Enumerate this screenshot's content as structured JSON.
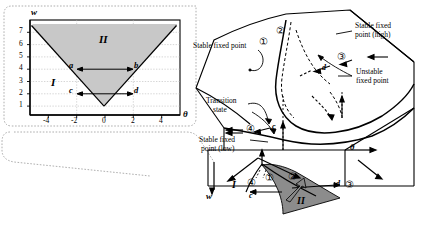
{
  "figure": {
    "type": "cusp-catastrophe-diagram"
  },
  "inset": {
    "name": "bifurcation-set-inset",
    "axes": {
      "x_label": "θ",
      "y_label": "w",
      "x_ticks": [
        "-4",
        "-2",
        "0",
        "2",
        "4"
      ],
      "y_ticks": [
        "1",
        "2",
        "3",
        "4",
        "5",
        "6",
        "7"
      ],
      "x_min": -5.3,
      "x_max": 5.3,
      "y_min": 0.3,
      "y_max": 7.6
    },
    "regions": [
      {
        "label": "I",
        "kind": "single-stable-state",
        "shaded": false
      },
      {
        "label": "II",
        "kind": "bistable-region",
        "shaded": true
      }
    ],
    "points": [
      {
        "label": "a",
        "theta": -2,
        "w": 4
      },
      {
        "label": "b",
        "theta": 2,
        "w": 4
      },
      {
        "label": "c",
        "theta": -2,
        "w": 2
      },
      {
        "label": "d",
        "theta": 2,
        "w": 2
      }
    ],
    "arrows": [
      {
        "from": "a",
        "to": "b",
        "double_headed": true
      },
      {
        "from": "c",
        "to": "d",
        "double_headed": true
      }
    ],
    "cusp_apex": {
      "theta": 0,
      "w": 1
    },
    "shade_color": "#c8c8c8"
  },
  "surface": {
    "name": "catastrophe-surface",
    "callouts": [
      {
        "id": "stable-fixed-point",
        "text": "Stable fixed  point"
      },
      {
        "id": "stable-fixed-point-high",
        "text_line1": "Stable fixed",
        "text_line2": "point (high)"
      },
      {
        "id": "unstable-fixed-point",
        "text_line1": "Unstable",
        "text_line2": "fixed point"
      },
      {
        "id": "transition-state",
        "text_line1": "Transition",
        "text_line2": "state"
      },
      {
        "id": "stable-fixed-point-low",
        "text_line1": "Stable fixed",
        "text_line2": "point (low)"
      }
    ],
    "path_markers": [
      "①",
      "②",
      "③",
      "④"
    ],
    "surface_points": [
      {
        "label": "d",
        "location": "upper-sheet"
      },
      {
        "label": "c",
        "location": "lower-sheet"
      }
    ]
  },
  "control_plane": {
    "name": "control-plane",
    "axes": {
      "x_label": "θ",
      "y_label": "w"
    },
    "regions": [
      {
        "label": "I",
        "shaded": false
      },
      {
        "label": "II",
        "shaded": true
      }
    ],
    "markers": [
      "①",
      "②",
      "③",
      "④"
    ],
    "points": [
      {
        "label": "c"
      },
      {
        "label": "d"
      }
    ],
    "shade_color": "#8c8c8c"
  },
  "colors": {
    "stroke": "#000000",
    "inset_shade": "#c8c8c8",
    "plane_shade": "#8c8c8c",
    "dotted_callout": "#9a9a9a",
    "grid": "#b4b4b4"
  }
}
